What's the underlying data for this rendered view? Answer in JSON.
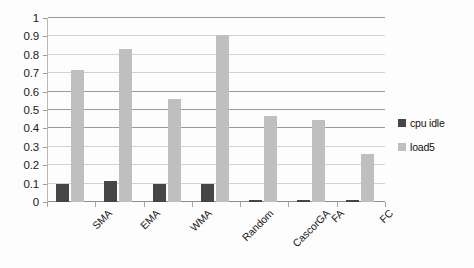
{
  "chart_data": {
    "type": "bar",
    "title": "",
    "subtitle": "",
    "xlabel": "",
    "ylabel": "",
    "ylim": [
      0,
      1
    ],
    "ytick_step": 0.1,
    "ytick_labels": [
      "1",
      "0.9",
      "0.8",
      "0.7",
      "0.6",
      "0.5",
      "0.4",
      "0.3",
      "0.2",
      "0.1",
      "0"
    ],
    "ytick_values": [
      1,
      0.9,
      0.8,
      0.7,
      0.6,
      0.5,
      0.4,
      0.3,
      0.2,
      0.1,
      0
    ],
    "grid": true,
    "grid_axis": "y",
    "legend_position": "right",
    "categories": [
      "SMA",
      "EMA",
      "WMA",
      "Random",
      "CascorGA",
      "FA",
      "FC"
    ],
    "series": [
      {
        "name": "cpu idle",
        "color": "#464646",
        "values": [
          0.1,
          0.115,
          0.1,
          0.1,
          0.013,
          0.01,
          0.01
        ]
      },
      {
        "name": "load5",
        "color": "#bfbfbf",
        "values": [
          0.72,
          0.83,
          0.56,
          0.905,
          0.47,
          0.445,
          0.26
        ]
      }
    ]
  },
  "legend": {
    "items": [
      {
        "label": "cpu idle",
        "swatch": "cpu"
      },
      {
        "label": "load5",
        "swatch": "load"
      }
    ]
  }
}
